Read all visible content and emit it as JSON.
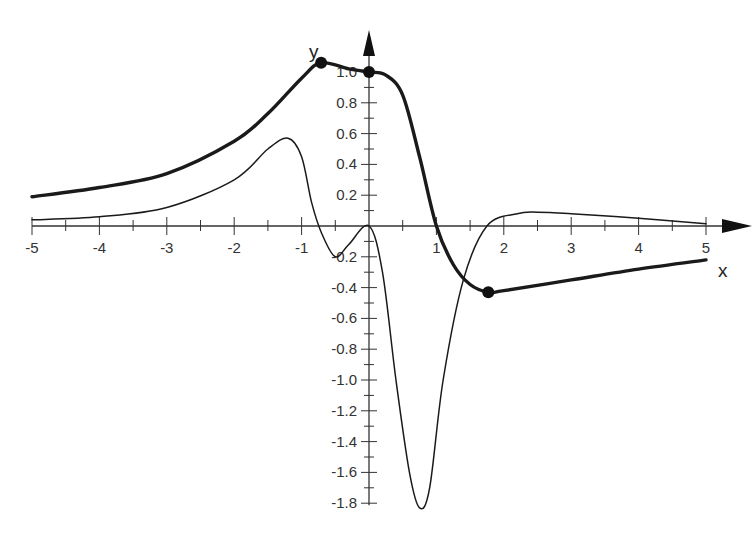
{
  "chart_data": {
    "type": "line",
    "title": "",
    "xlabel": "x",
    "ylabel": "y",
    "xlim": [
      -5,
      5
    ],
    "ylim": [
      -1.8,
      1.1
    ],
    "grid": false,
    "legend": null,
    "x_ticks": [
      "-5",
      "-4",
      "-3",
      "-2",
      "-1",
      "1",
      "2",
      "3",
      "4",
      "5"
    ],
    "y_ticks": [
      "1.0",
      "0.8",
      "0.6",
      "0.4",
      "0.2",
      "-0.2",
      "-0.4",
      "-0.6",
      "-0.8",
      "-1.0",
      "-1.2",
      "-1.4",
      "-1.6",
      "-1.8"
    ],
    "series": [
      {
        "name": "thick curve",
        "style": "bold",
        "x": [
          -5,
          -4,
          -3,
          -2,
          -1.5,
          -1,
          -0.71,
          -0.3,
          0,
          0.25,
          0.5,
          0.75,
          1.0,
          1.25,
          1.5,
          1.77,
          2,
          3,
          4,
          5
        ],
        "y": [
          0.19,
          0.25,
          0.34,
          0.55,
          0.73,
          0.96,
          1.06,
          1.02,
          1.0,
          0.98,
          0.85,
          0.45,
          0.0,
          -0.25,
          -0.38,
          -0.43,
          -0.42,
          -0.35,
          -0.28,
          -0.22
        ]
      },
      {
        "name": "thin curve",
        "style": "thin",
        "x": [
          -5,
          -4,
          -3,
          -2,
          -1.5,
          -1.2,
          -1.0,
          -0.85,
          -0.7,
          -0.5,
          -0.3,
          0,
          0.2,
          0.4,
          0.6,
          0.75,
          0.9,
          1.1,
          1.4,
          1.75,
          2.2,
          2.5,
          3,
          4,
          5
        ],
        "y": [
          0.04,
          0.06,
          0.12,
          0.3,
          0.5,
          0.57,
          0.45,
          0.15,
          -0.05,
          -0.2,
          -0.12,
          0.0,
          -0.3,
          -1.0,
          -1.6,
          -1.83,
          -1.7,
          -1.0,
          -0.35,
          0.0,
          0.08,
          0.09,
          0.08,
          0.05,
          0.015
        ]
      }
    ],
    "marked_points": [
      {
        "x": -0.71,
        "y": 1.06,
        "label": "maximum"
      },
      {
        "x": 0,
        "y": 1.0,
        "label": "y-intercept"
      },
      {
        "x": 1.77,
        "y": -0.43,
        "label": "minimum"
      }
    ]
  }
}
